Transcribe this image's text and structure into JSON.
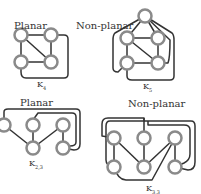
{
  "panels": [
    {
      "id": "k4",
      "title": "Planar",
      "graph_label": "K",
      "graph_sub": "4"
    },
    {
      "id": "k5",
      "title": "Non-planar",
      "graph_label": "K",
      "graph_sub": "5"
    },
    {
      "id": "k33",
      "title": "Planar",
      "graph_label": "K",
      "graph_sub": "2,3"
    },
    {
      "id": "k34",
      "title": "Non-planar",
      "graph_label": "K",
      "graph_sub": "3,3"
    }
  ],
  "colors": {
    "node_stroke": "#8a8a8a",
    "node_fill": "#ffffff",
    "edge": "#333333"
  }
}
